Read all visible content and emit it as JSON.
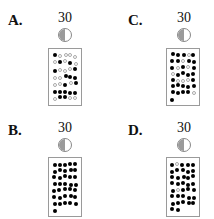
{
  "options": [
    {
      "key": "A",
      "label": "A.",
      "number": "30",
      "moon_icon": "first-quarter-moon-icon",
      "filled_dots": 17,
      "open_dots": 18
    },
    {
      "key": "C",
      "label": "C.",
      "number": "30",
      "moon_icon": "first-quarter-moon-icon",
      "filled_dots": 27,
      "open_dots": 9
    },
    {
      "key": "B",
      "label": "B.",
      "number": "30",
      "moon_icon": "first-quarter-moon-icon",
      "filled_dots": 36,
      "open_dots": 0
    },
    {
      "key": "D",
      "label": "D.",
      "number": "30",
      "moon_icon": "first-quarter-moon-icon",
      "filled_dots": 35,
      "open_dots": 2
    }
  ],
  "colors": {
    "filled": "#000000",
    "open": "#aaaaaa",
    "moon_dark": "#9a9a9a",
    "border": "#9a9a9a"
  }
}
